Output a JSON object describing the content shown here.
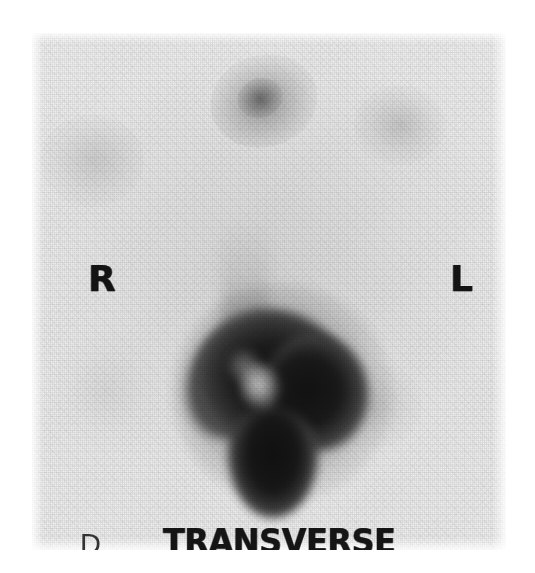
{
  "study": {
    "modality": "nuclear-medicine-scintigraphy",
    "orientation_label": "TRANSVERSE",
    "detector_label": "D",
    "marker_right": "R",
    "marker_left": "L"
  },
  "colors": {
    "page_background": "#ffffff",
    "film_background": "#eeeeee",
    "annotation_text": "#141414",
    "detector_text": "#333333",
    "hotspot_peak": "#141414",
    "photopenic_center": "#c8c8c8"
  },
  "scan_field": {
    "left": 32,
    "top": 33,
    "width": 474,
    "height": 517
  },
  "findings": [
    {
      "name": "central-intense-uptake",
      "position": "center-inferior",
      "intensity": "intense"
    },
    {
      "name": "photopenic-center",
      "position": "center",
      "intensity": "cold"
    },
    {
      "name": "sternal-focus",
      "position": "upper-center",
      "intensity": "faint"
    },
    {
      "name": "upper-right-focus",
      "position": "upper-left-of-patient",
      "intensity": "very-faint"
    },
    {
      "name": "upper-left-focus",
      "position": "upper-right-of-patient",
      "intensity": "very-faint"
    },
    {
      "name": "mid-right-focus",
      "position": "mid-left-of-patient",
      "intensity": "very-faint"
    }
  ]
}
